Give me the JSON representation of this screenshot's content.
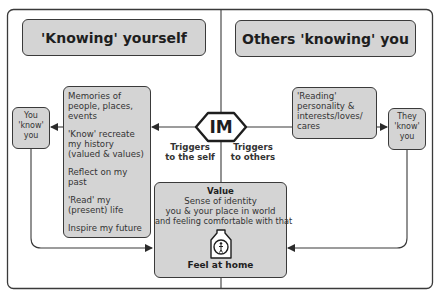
{
  "diagram": {
    "headers": {
      "left": "'Knowing' yourself",
      "right": "Others 'knowing' you"
    },
    "center_node": {
      "label": "IM",
      "left_trigger": [
        "Triggers",
        "to the self"
      ],
      "right_trigger": [
        "Triggers",
        "to others"
      ]
    },
    "self_box": {
      "items": [
        "Memories of people, places, events",
        "'Know' recreate my history (valued & values)",
        "Reflect on my past",
        "'Read' my (present) life",
        "Inspire my future"
      ]
    },
    "you_know_you": [
      "You",
      "'know'",
      "you"
    ],
    "others_box": {
      "text": "'Reading' personality & interests/loves/ cares"
    },
    "they_know_you": [
      "They",
      "'know'",
      "you"
    ],
    "value_box": {
      "title": "Value",
      "lines": [
        "Sense of identity",
        "you & your place in world",
        "and feeling comfortable with that"
      ],
      "icon": "home-person-icon",
      "footer": "Feel at home"
    },
    "colors": {
      "box_fill": "#d4d4d4",
      "line": "#3a3a3a",
      "background": "#ffffff"
    }
  }
}
